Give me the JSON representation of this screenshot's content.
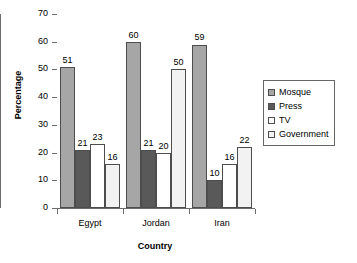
{
  "chart_data": {
    "type": "bar",
    "title": "",
    "xlabel": "Country",
    "ylabel": "Percentage",
    "categories": [
      "Egypt",
      "Jordan",
      "Iran"
    ],
    "series": [
      {
        "name": "Mosque",
        "color": "#a6a6a6",
        "values": [
          51,
          60,
          59
        ]
      },
      {
        "name": "Press",
        "color": "#595959",
        "values": [
          21,
          21,
          10
        ]
      },
      {
        "name": "TV",
        "color": "#ffffff",
        "values": [
          23,
          20,
          16
        ]
      },
      {
        "name": "Government",
        "color": "#f2f2f2",
        "values": [
          16,
          50,
          22
        ]
      }
    ],
    "ylim": [
      0,
      70
    ],
    "yticks": [
      0,
      10,
      20,
      30,
      40,
      50,
      60,
      70
    ],
    "grid": false,
    "legend_position": "right",
    "show_value_labels": true
  },
  "legend": {
    "entries": [
      "Mosque",
      "Press",
      "TV",
      "Government"
    ]
  }
}
